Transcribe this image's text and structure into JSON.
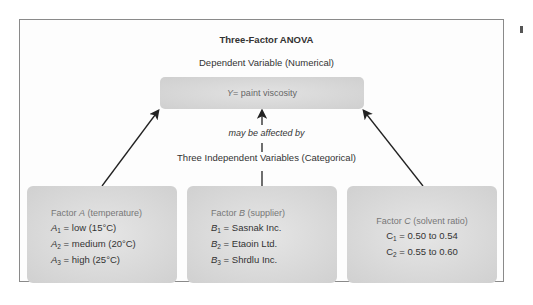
{
  "title": "Three-Factor ANOVA",
  "dependent_label": "Dependent Variable (Numerical)",
  "response": {
    "symbol": "Y",
    "text": " = paint viscosity"
  },
  "relation_label": "may be affected by",
  "independent_label": "Three Independent Variables (Categorical)",
  "factors": [
    {
      "prefix": "Factor ",
      "letter": "A",
      "desc": " (temperature)",
      "levels": [
        {
          "sym": "A",
          "sub": "1",
          "text": " = low (15°C)"
        },
        {
          "sym": "A",
          "sub": "2",
          "text": " = medium (20°C)"
        },
        {
          "sym": "A",
          "sub": "3",
          "text": " = high (25°C)"
        }
      ]
    },
    {
      "prefix": "Factor ",
      "letter": "B",
      "desc": " (supplier)",
      "levels": [
        {
          "sym": "B",
          "sub": "1",
          "text": " = Sasnak Inc."
        },
        {
          "sym": "B",
          "sub": "2",
          "text": " = Etaoin Ltd."
        },
        {
          "sym": "B",
          "sub": "3",
          "text": " = Shrdlu Inc."
        }
      ]
    },
    {
      "prefix": "Factor ",
      "letter": "C",
      "desc": " (solvent ratio)",
      "levels": [
        {
          "sym": "C",
          "sub": "1",
          "text": " = 0.50 to 0.54"
        },
        {
          "sym": "C",
          "sub": "2",
          "text": " = 0.55 to 0.60"
        }
      ]
    }
  ],
  "colors": {
    "box_fill": "#d6d6d6",
    "frame": "#8a8a8a",
    "arrow": "#222222",
    "text": "#333333",
    "muted_text": "#777777"
  }
}
